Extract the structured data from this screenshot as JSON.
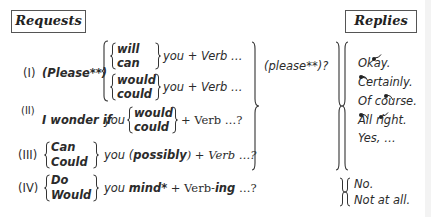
{
  "headers": {
    "requests": "Requests",
    "replies": "Replies"
  },
  "requests": {
    "I": {
      "label": "(I)",
      "please": "(Please**)",
      "group1": [
        "will",
        "can"
      ],
      "group2": [
        "would",
        "could"
      ],
      "tail1": "you + Verb …",
      "tail2": "you + Verb …"
    },
    "II": {
      "label": "(II)",
      "prefix_bold": "I wonder if",
      "prefix_you": "you",
      "group": [
        "would",
        "could"
      ],
      "tail": "+ Verb …?"
    },
    "III": {
      "label": "(III)",
      "group": [
        "Can",
        "Could"
      ],
      "tail_you": "you (",
      "tail_possibly": "possibly",
      "tail_rest": ") + Verb …?"
    },
    "IV": {
      "label": "(IV)",
      "group": [
        "Do",
        "Would"
      ],
      "tail_you": "you",
      "tail_mind": "mind*",
      "tail_plus": "+ Verb-",
      "tail_ing": "ing",
      "tail_end": " …?"
    },
    "please_suffix": "(please**)?"
  },
  "replies": {
    "positive": [
      "Okay.",
      "Certainly.",
      "Of course.",
      "All right.",
      "Yes, …"
    ],
    "negative": [
      "No.",
      "Not at all."
    ]
  }
}
